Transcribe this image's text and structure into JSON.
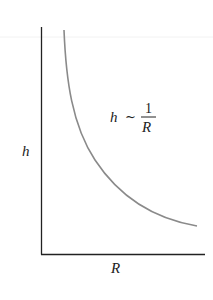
{
  "diagram": {
    "x_axis_label": "R",
    "y_axis_label": "h",
    "annotation": {
      "lhs": "h",
      "relation": "~",
      "numerator": "1",
      "denominator": "R"
    },
    "curve": {
      "type": "inverse",
      "description": "h proportional to 1/R",
      "color": "#8a8a8a"
    },
    "axis_color": "#222222"
  }
}
